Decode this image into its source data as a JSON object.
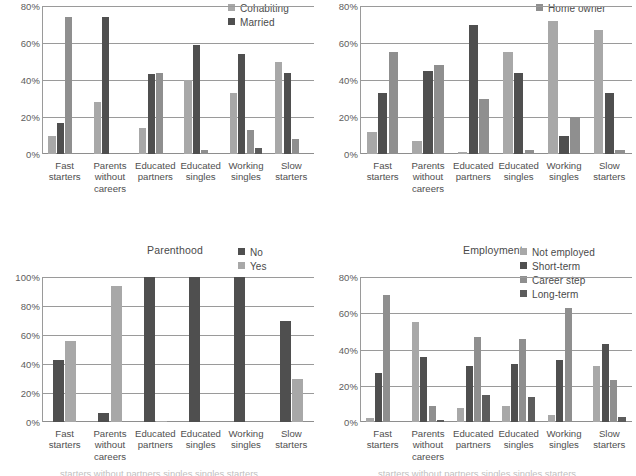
{
  "figure": {
    "categories": [
      "Fast starters",
      "Parents without careers",
      "Educated partners",
      "Educated singles",
      "Working singles",
      "Slow starters"
    ],
    "category_lines": [
      [
        "Fast",
        "starters"
      ],
      [
        "Parents",
        "without",
        "careers"
      ],
      [
        "Educated",
        "partners"
      ],
      [
        "Educated",
        "singles"
      ],
      [
        "Working",
        "singles"
      ],
      [
        "Slow",
        "starters"
      ]
    ],
    "colors": {
      "light_gray": "#a8a8a8",
      "mid_gray": "#8f8f8f",
      "dark_gray": "#4f4f4f",
      "darker_gray": "#5c5c5c",
      "gridline": "#9a9a9a",
      "text": "#4a4a4a"
    },
    "bottom_caption": "starters  without  partners  singles  singles  starters"
  },
  "chart_data": [
    {
      "id": "partnership",
      "type": "bar",
      "title": "",
      "position": "top-left",
      "note": "Panel is cropped at the top; title not visible.",
      "categories": [
        "Fast starters",
        "Parents without careers",
        "Educated partners",
        "Educated singles",
        "Working singles",
        "Slow starters"
      ],
      "series": [
        {
          "name": "Cohabiting",
          "color": "#a8a8a8",
          "values": [
            10,
            28,
            14,
            40,
            33,
            50
          ]
        },
        {
          "name": "Married",
          "color": "#4f4f4f",
          "values": [
            17,
            74,
            43,
            59,
            54,
            44
          ]
        },
        {
          "name": "",
          "color": "#8f8f8f",
          "values": [
            74,
            0,
            44,
            2,
            13,
            8
          ]
        },
        {
          "name": "",
          "color": "#5c5c5c",
          "values": [
            0,
            0,
            0,
            0,
            3,
            0
          ]
        }
      ],
      "legend": [
        "Cohabiting",
        "Married"
      ],
      "legend_position": "top-right",
      "ylabel": "",
      "xlabel": "",
      "ylim": [
        0,
        80
      ],
      "yticks": [
        0,
        20,
        40,
        60,
        80
      ],
      "ytick_labels": [
        "0%",
        "20%",
        "40%",
        "60%",
        "80%"
      ],
      "grid": true
    },
    {
      "id": "housing",
      "type": "bar",
      "title": "",
      "position": "top-right",
      "note": "Panel is cropped at the top; only the 'Home owner' legend entry is visible.",
      "categories": [
        "Fast starters",
        "Parents without careers",
        "Educated partners",
        "Educated singles",
        "Working singles",
        "Slow starters"
      ],
      "series": [
        {
          "name": "",
          "color": "#a8a8a8",
          "values": [
            12,
            7,
            1,
            55,
            72,
            67
          ]
        },
        {
          "name": "",
          "color": "#4f4f4f",
          "values": [
            33,
            45,
            70,
            44,
            10,
            33
          ]
        },
        {
          "name": "Home owner",
          "color": "#8f8f8f",
          "values": [
            55,
            48,
            30,
            2,
            20,
            2
          ]
        }
      ],
      "legend": [
        "Home owner"
      ],
      "legend_position": "top-right",
      "ylabel": "",
      "xlabel": "",
      "ylim": [
        0,
        80
      ],
      "yticks": [
        0,
        20,
        40,
        60,
        80
      ],
      "ytick_labels": [
        "0%",
        "20%",
        "40%",
        "60%",
        "80%"
      ],
      "grid": true
    },
    {
      "id": "parenthood",
      "type": "bar",
      "title": "Parenthood",
      "position": "bottom-left",
      "categories": [
        "Fast starters",
        "Parents without careers",
        "Educated partners",
        "Educated singles",
        "Working singles",
        "Slow starters"
      ],
      "series": [
        {
          "name": "No",
          "color": "#4f4f4f",
          "values": [
            43,
            6,
            100,
            100,
            100,
            70
          ]
        },
        {
          "name": "Yes",
          "color": "#a8a8a8",
          "values": [
            56,
            94,
            1,
            0,
            0,
            30
          ]
        }
      ],
      "legend": [
        "No",
        "Yes"
      ],
      "legend_position": "top-right",
      "ylabel": "",
      "xlabel": "",
      "ylim": [
        0,
        100
      ],
      "yticks": [
        0,
        20,
        40,
        60,
        80,
        100
      ],
      "ytick_labels": [
        "0%",
        "20%",
        "40%",
        "60%",
        "80%",
        "100%"
      ],
      "grid": true
    },
    {
      "id": "employment",
      "type": "bar",
      "title": "Employment",
      "position": "bottom-right",
      "categories": [
        "Fast starters",
        "Parents without careers",
        "Educated partners",
        "Educated singles",
        "Working singles",
        "Slow starters"
      ],
      "series": [
        {
          "name": "Not employed",
          "color": "#a8a8a8",
          "values": [
            2,
            55,
            8,
            9,
            4,
            31
          ]
        },
        {
          "name": "Short-term",
          "color": "#4f4f4f",
          "values": [
            27,
            36,
            31,
            32,
            34,
            43
          ]
        },
        {
          "name": "Career step",
          "color": "#8f8f8f",
          "values": [
            70,
            9,
            47,
            46,
            63,
            23
          ]
        },
        {
          "name": "Long-term",
          "color": "#5c5c5c",
          "values": [
            0,
            1,
            15,
            14,
            0,
            3
          ]
        }
      ],
      "legend": [
        "Not employed",
        "Short-term",
        "Career step",
        "Long-term"
      ],
      "legend_position": "top-right",
      "ylabel": "",
      "xlabel": "",
      "ylim": [
        0,
        80
      ],
      "yticks": [
        0,
        20,
        40,
        60,
        80
      ],
      "ytick_labels": [
        "0%",
        "20%",
        "40%",
        "60%",
        "80%"
      ],
      "grid": true
    }
  ]
}
